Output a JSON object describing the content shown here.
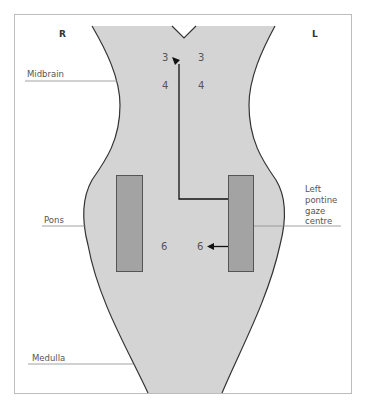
{
  "diagram": {
    "side_labels": {
      "right": "R",
      "left": "L"
    },
    "region_labels": {
      "midbrain": "Midbrain",
      "pons": "Pons",
      "medulla": "Medulla"
    },
    "gaze_centre_label": {
      "line1": "Left",
      "line2": "pontine",
      "line3": "gaze",
      "line4": "centre"
    },
    "nuclei": {
      "cn3_right": "3",
      "cn3_left": "3",
      "cn4_right": "4",
      "cn4_left": "4",
      "cn6_right": "6",
      "cn6_left": "6"
    },
    "colors": {
      "brainstem_fill": "#d4d4d4",
      "outline": "#333333",
      "gaze_centre_fill": "#a3a3a3",
      "gaze_centre_stroke": "#555555",
      "frame": "#bdbdbd",
      "pointer_line": "#8a8a8a",
      "pathway": "#111111"
    }
  }
}
